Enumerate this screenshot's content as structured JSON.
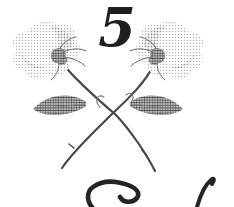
{
  "page": {
    "background_color": "#ffffff",
    "chapter_number": "5",
    "ink_color": "#1f1f1f"
  },
  "ornament": {
    "type": "crossed-roses",
    "bloom_dot_color": "#b3b3b3",
    "bloom_shade_dot_color": "#8c8c8c",
    "leaf_dot_color": "#3f3f3f",
    "calyx_outline_color": "#666666",
    "stem_color": "#474747",
    "sepal_color": "#6a6a6a",
    "tendril_color": "#7a7a7a",
    "leaf_rib_color": "#777777"
  },
  "footer": {
    "script_ink_color": "#242424"
  }
}
